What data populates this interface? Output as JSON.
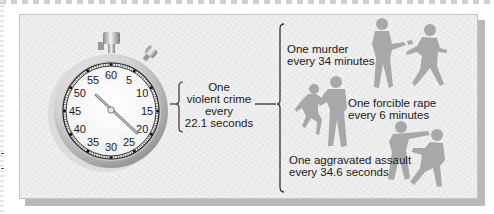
{
  "diagram": {
    "stopwatch": {
      "dial_labels": [
        "60",
        "5",
        "10",
        "15",
        "20",
        "25",
        "30",
        "35",
        "40",
        "45",
        "50",
        "55"
      ],
      "hand_position_seconds": 22.1
    },
    "summary": {
      "line1": "One",
      "line2": "violent crime",
      "line3": "every",
      "line4": "22.1 seconds"
    },
    "categories": [
      {
        "line1": "One murder",
        "line2": "every 34 minutes",
        "figure": "shooting-silhouette"
      },
      {
        "line1": "One forcible rape",
        "line2": "every 6 minutes",
        "figure": "struggle-silhouette"
      },
      {
        "line1": "One aggravated assault",
        "line2": "every 34.6 seconds",
        "figure": "punch-silhouette"
      }
    ],
    "colors": {
      "panel_bg": "#ececec",
      "panel_shadow": "#b9b9b9",
      "text": "#1a1a1a",
      "silhouette": "#a8a8a8",
      "bracket": "#333333"
    }
  }
}
